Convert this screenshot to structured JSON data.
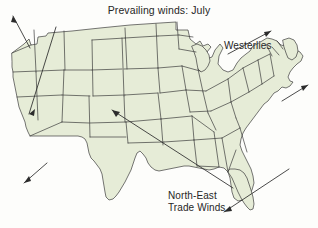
{
  "figure": {
    "title": "Prevailing winds: July",
    "type": "map-diagram",
    "region": "United States",
    "background_color": "#fdfdfb",
    "land_fill_color": "#e6ecd7",
    "border_color": "#3c3c3c",
    "text_color": "#262626"
  },
  "labels": {
    "westerlies": "Westerlies",
    "trade_winds_line1": "North-East",
    "trade_winds_line2": "Trade Winds"
  },
  "wind_systems": [
    {
      "name": "Westerlies",
      "label": "Westerlies",
      "direction": "toward north-east",
      "arrow_count": 4
    },
    {
      "name": "North-East Trade Winds",
      "label": "North-East Trade Winds",
      "direction": "toward south-west",
      "arrow_count": 3
    }
  ],
  "arrows": [
    {
      "name": "arrow-pacific-northwest",
      "x1": 30,
      "y1": 48,
      "x2": 12,
      "y2": 15,
      "head_at": "end"
    },
    {
      "name": "arrow-california-nevada",
      "x1": 56,
      "y1": 27,
      "x2": 28,
      "y2": 113,
      "head_at": "end"
    },
    {
      "name": "arrow-southwest-offshore",
      "x1": 46,
      "y1": 163,
      "x2": 24,
      "y2": 182,
      "head_at": "end"
    },
    {
      "name": "arrow-central-plains-diagonal",
      "x1": 112,
      "y1": 110,
      "x2": 232,
      "y2": 187,
      "head_at": "end"
    },
    {
      "name": "arrow-westerlies-upper",
      "x1": 229,
      "y1": 53,
      "x2": 270,
      "y2": 31,
      "head_at": "end"
    },
    {
      "name": "arrow-westerlies-atlantic",
      "x1": 283,
      "y1": 100,
      "x2": 307,
      "y2": 85,
      "head_at": "end"
    },
    {
      "name": "arrow-trade-winds-florida",
      "x1": 288,
      "y1": 170,
      "x2": 225,
      "y2": 211,
      "head_at": "end"
    }
  ]
}
